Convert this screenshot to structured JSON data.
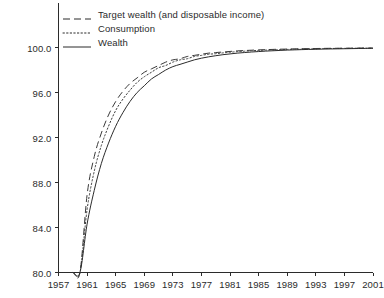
{
  "chart_data": {
    "type": "line",
    "title": "",
    "xlabel": "",
    "ylabel": "",
    "xlim": [
      1957,
      2001
    ],
    "ylim": [
      80.0,
      100.0
    ],
    "grid": false,
    "legend_position": "upper-left-inside",
    "xticks": [
      "1957",
      "1961",
      "1965",
      "1969",
      "1973",
      "1977",
      "1981",
      "1985",
      "1989",
      "1993",
      "1997",
      "2001"
    ],
    "xtick_values": [
      1957,
      1961,
      1965,
      1969,
      1973,
      1977,
      1981,
      1985,
      1989,
      1993,
      1997,
      2001
    ],
    "yticks": [
      "80.0",
      "84.0",
      "88.0",
      "92.0",
      "96.0",
      "100.0"
    ],
    "ytick_values": [
      80.0,
      84.0,
      88.0,
      92.0,
      96.0,
      100.0
    ],
    "x": [
      1957,
      1958,
      1959,
      1960,
      1961,
      1962,
      1963,
      1964,
      1965,
      1966,
      1967,
      1968,
      1969,
      1970,
      1971,
      1972,
      1973,
      1974,
      1975,
      1976,
      1977,
      1978,
      1979,
      1980,
      1981,
      1982,
      1983,
      1984,
      1985,
      1986,
      1987,
      1988,
      1989,
      1990,
      1991,
      1992,
      1993,
      1994,
      1995,
      1996,
      1997,
      1998,
      1999,
      2000,
      2001
    ],
    "series": [
      {
        "name": "Target wealth (and disposable income)",
        "style": "dashed",
        "color": "#3a3a3a",
        "values": [
          80.0,
          80.0,
          80.0,
          80.0,
          86.9,
          90.3,
          92.4,
          94.0,
          95.2,
          96.1,
          96.8,
          97.3,
          97.8,
          98.1,
          98.4,
          98.7,
          98.9,
          99.0,
          99.2,
          99.3,
          99.4,
          99.5,
          99.55,
          99.6,
          99.65,
          99.7,
          99.73,
          99.76,
          99.79,
          99.81,
          99.83,
          99.85,
          99.86,
          99.88,
          99.89,
          99.9,
          99.91,
          99.92,
          99.93,
          99.93,
          99.94,
          99.94,
          99.95,
          99.95,
          99.95
        ]
      },
      {
        "name": "Consumption",
        "style": "dotted",
        "color": "#3a3a3a",
        "values": [
          80.0,
          80.0,
          80.0,
          80.0,
          85.6,
          89.0,
          91.3,
          93.0,
          94.4,
          95.4,
          96.2,
          96.9,
          97.4,
          97.8,
          98.2,
          98.4,
          98.7,
          98.9,
          99.0,
          99.2,
          99.3,
          99.4,
          99.45,
          99.52,
          99.58,
          99.63,
          99.67,
          99.71,
          99.74,
          99.77,
          99.79,
          99.81,
          99.83,
          99.85,
          99.86,
          99.88,
          99.89,
          99.9,
          99.91,
          99.92,
          99.92,
          99.93,
          99.94,
          99.94,
          99.95
        ]
      },
      {
        "name": "Wealth",
        "style": "solid",
        "color": "#2b2b2b",
        "values": [
          80.0,
          80.0,
          80.0,
          80.0,
          84.3,
          87.3,
          89.7,
          91.5,
          93.0,
          94.2,
          95.2,
          96.0,
          96.6,
          97.2,
          97.6,
          98.0,
          98.3,
          98.5,
          98.7,
          98.9,
          99.05,
          99.17,
          99.27,
          99.36,
          99.43,
          99.5,
          99.55,
          99.6,
          99.64,
          99.68,
          99.71,
          99.74,
          99.77,
          99.79,
          99.81,
          99.83,
          99.84,
          99.86,
          99.87,
          99.88,
          99.89,
          99.9,
          99.91,
          99.92,
          99.93
        ]
      }
    ]
  },
  "legend": {
    "items": [
      {
        "label": "Target wealth (and disposable income)",
        "style": "dashed"
      },
      {
        "label": "Consumption",
        "style": "dotted"
      },
      {
        "label": "Wealth",
        "style": "solid"
      }
    ]
  },
  "axes": {
    "axis_color": "#2b2b2b"
  }
}
